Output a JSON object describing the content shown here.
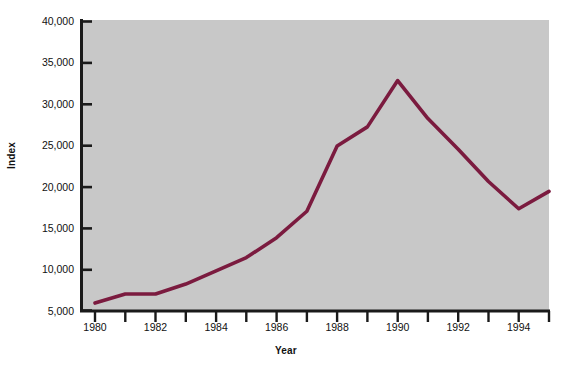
{
  "chart_data": {
    "type": "line",
    "title": "",
    "xlabel": "Year",
    "ylabel": "Index",
    "x": [
      1980,
      1981,
      1982,
      1983,
      1984,
      1985,
      1986,
      1987,
      1988,
      1989,
      1990,
      1991,
      1992,
      1993,
      1994,
      1995
    ],
    "values": [
      5900,
      7000,
      7000,
      8200,
      9800,
      11400,
      13800,
      17000,
      24900,
      27200,
      32800,
      28200,
      24500,
      20600,
      17300,
      19400
    ],
    "series": [
      {
        "name": "Index",
        "values": [
          5900,
          7000,
          7000,
          8200,
          9800,
          11400,
          13800,
          17000,
          24900,
          27200,
          32800,
          28200,
          24500,
          20600,
          17300,
          19400
        ]
      }
    ],
    "xlim": [
      1980,
      1995
    ],
    "ylim": [
      5000,
      40000
    ],
    "ytick_values": [
      5000,
      10000,
      15000,
      20000,
      25000,
      30000,
      35000,
      40000
    ],
    "ytick_labels": [
      "5,000",
      "10,000",
      "15,000",
      "20,000",
      "25,000",
      "30,000",
      "35,000",
      "40,000"
    ],
    "xtick_values": [
      1980,
      1981,
      1982,
      1983,
      1984,
      1985,
      1986,
      1987,
      1988,
      1989,
      1990,
      1991,
      1992,
      1993,
      1994,
      1995
    ],
    "xtick_labels_shown": [
      "1980",
      "1982",
      "1984",
      "1986",
      "1988",
      "1990",
      "1992",
      "1994"
    ],
    "xtick_labels_shown_values": [
      1980,
      1982,
      1984,
      1986,
      1988,
      1990,
      1992,
      1994
    ],
    "grid": false,
    "legend": "none",
    "line_color": "#7B1B3F",
    "plot_background": "#c6c6c6",
    "figure_background": "#ffffff",
    "axis_color": "#1a1a1a"
  }
}
